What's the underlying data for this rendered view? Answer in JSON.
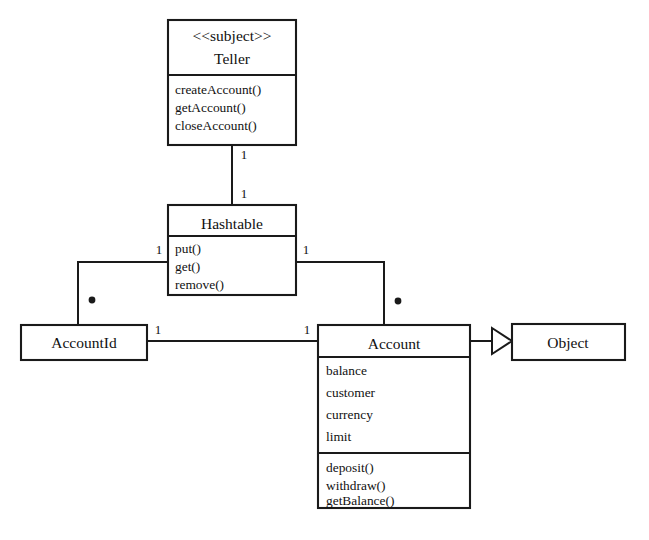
{
  "diagram": {
    "kind": "uml-class-diagram",
    "background_color": "#ffffff",
    "line_color": "#1a1a1a",
    "text_color": "#111111",
    "classes": [
      {
        "id": "teller",
        "stereotype": "<<subject>>",
        "name": "Teller",
        "attributes": [],
        "operations": [
          "createAccount()",
          "getAccount()",
          "closeAccount()"
        ]
      },
      {
        "id": "hashtable",
        "stereotype": "",
        "name": "Hashtable",
        "attributes": [],
        "operations": [
          "put()",
          "get()",
          "remove()"
        ]
      },
      {
        "id": "accountid",
        "stereotype": "",
        "name": "AccountId",
        "attributes": [],
        "operations": []
      },
      {
        "id": "account",
        "stereotype": "",
        "name": "Account",
        "attributes": [
          "balance",
          "customer",
          "currency",
          "limit"
        ],
        "operations": [
          "deposit()",
          "withdraw()",
          "getBalance()"
        ]
      },
      {
        "id": "object",
        "stereotype": "",
        "name": "Object",
        "attributes": [],
        "operations": []
      }
    ],
    "relationships": [
      {
        "id": "teller-hashtable",
        "type": "association",
        "from": "teller",
        "to": "hashtable",
        "from_multiplicity": "1",
        "to_multiplicity": "1"
      },
      {
        "id": "hashtable-accountid",
        "type": "association",
        "from": "hashtable",
        "to": "accountid",
        "from_multiplicity": "1",
        "to_multiplicity": "*"
      },
      {
        "id": "hashtable-account",
        "type": "association",
        "from": "hashtable",
        "to": "account",
        "from_multiplicity": "1",
        "to_multiplicity": "*"
      },
      {
        "id": "accountid-account",
        "type": "association",
        "from": "accountid",
        "to": "account",
        "from_multiplicity": "1",
        "to_multiplicity": "1"
      },
      {
        "id": "account-object",
        "type": "generalization",
        "from": "account",
        "to": "object",
        "from_multiplicity": "",
        "to_multiplicity": ""
      }
    ],
    "multiplicity_labels": {
      "teller_bottom": "1",
      "hashtable_top": "1",
      "hashtable_left": "1",
      "hashtable_right": "1",
      "accountid_top": "*",
      "accountid_right": "1",
      "account_top": "*",
      "account_left": "1"
    },
    "caption": ""
  }
}
